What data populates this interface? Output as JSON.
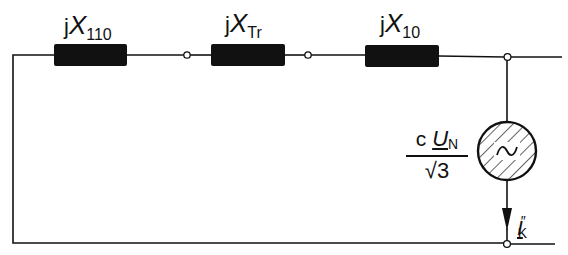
{
  "diagram": {
    "type": "equivalent-circuit-short-circuit",
    "colors": {
      "line": "#111111",
      "fill": "#111111",
      "background": "#ffffff"
    },
    "components": [
      {
        "id": "X110",
        "kind": "reactance",
        "label_prefix": "j",
        "label_symbol": "X",
        "label_subscript": "110"
      },
      {
        "id": "XTr",
        "kind": "reactance",
        "label_prefix": "j",
        "label_symbol": "X",
        "label_subscript": "Tr"
      },
      {
        "id": "X10",
        "kind": "reactance",
        "label_prefix": "j",
        "label_symbol": "X",
        "label_subscript": "10"
      },
      {
        "id": "source",
        "kind": "ac-voltage-source",
        "symbol": "~"
      }
    ],
    "source_label": {
      "numerator_factor": "c",
      "numerator_symbol": "U",
      "numerator_subscript": "N",
      "denominator": "√3"
    },
    "current_label": {
      "symbol": "I",
      "superscript": "″",
      "subscript": "K"
    }
  }
}
